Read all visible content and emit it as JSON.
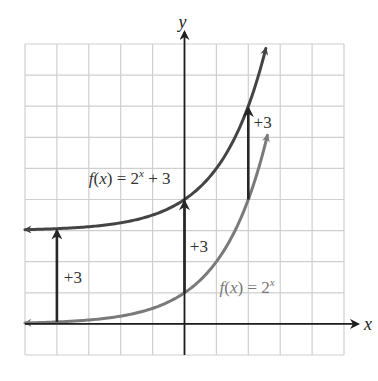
{
  "chart_data": {
    "type": "line",
    "title": "",
    "xlabel": "x",
    "ylabel": "y",
    "xlim": [
      -5,
      5
    ],
    "ylim": [
      -1,
      9
    ],
    "grid": true,
    "grid_step": 1,
    "tick_labels_shown": false,
    "series": [
      {
        "name": "f(x) = 2^x + 3",
        "label_main": "f(x) = 2",
        "label_sup": "x",
        "label_tail": " + 3",
        "function": "2^x + 3",
        "x_range": [
          -5,
          2.55
        ],
        "color": "#444444",
        "label_anchor": [
          -3.0,
          4.5
        ]
      },
      {
        "name": "f(x) = 2^x",
        "label_main": "f(x) = 2",
        "label_sup": "x",
        "label_tail": "",
        "function": "2^x",
        "x_range": [
          -5,
          2.6
        ],
        "color": "#7a7a7a",
        "label_anchor": [
          1.1,
          1.0
        ]
      }
    ],
    "annotations": [
      {
        "type": "arrow",
        "x": -4,
        "from_y": 0.0625,
        "to_y": 3.0625,
        "text": "+3",
        "text_pos": [
          -3.5,
          1.5
        ]
      },
      {
        "type": "arrow",
        "x": 0,
        "from_y": 1,
        "to_y": 4,
        "text": "+3",
        "text_pos": [
          0.45,
          2.5
        ]
      },
      {
        "type": "arrow",
        "x": 2,
        "from_y": 4,
        "to_y": 7,
        "text": "+3",
        "text_pos": [
          2.45,
          6.5
        ]
      }
    ],
    "colors": {
      "grid": "#cfcfcf",
      "axes": "#1e1e1e",
      "arrows": "#262626",
      "text": "#333333",
      "label_gray": "#777777"
    }
  }
}
